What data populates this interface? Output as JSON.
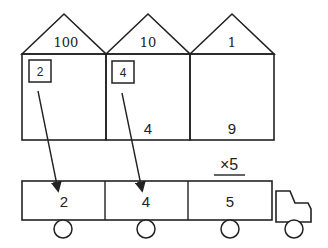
{
  "diagram": {
    "houses": [
      {
        "place_value": "100",
        "carry": "2",
        "digit": ""
      },
      {
        "place_value": "10",
        "carry": "4",
        "digit": "4"
      },
      {
        "place_value": "1",
        "carry": "",
        "digit": "9"
      }
    ],
    "multiplier": "×5",
    "truck": {
      "compartments": [
        "2",
        "4",
        "5"
      ]
    },
    "colors": {
      "stroke": "#222222",
      "background": "#ffffff"
    }
  }
}
